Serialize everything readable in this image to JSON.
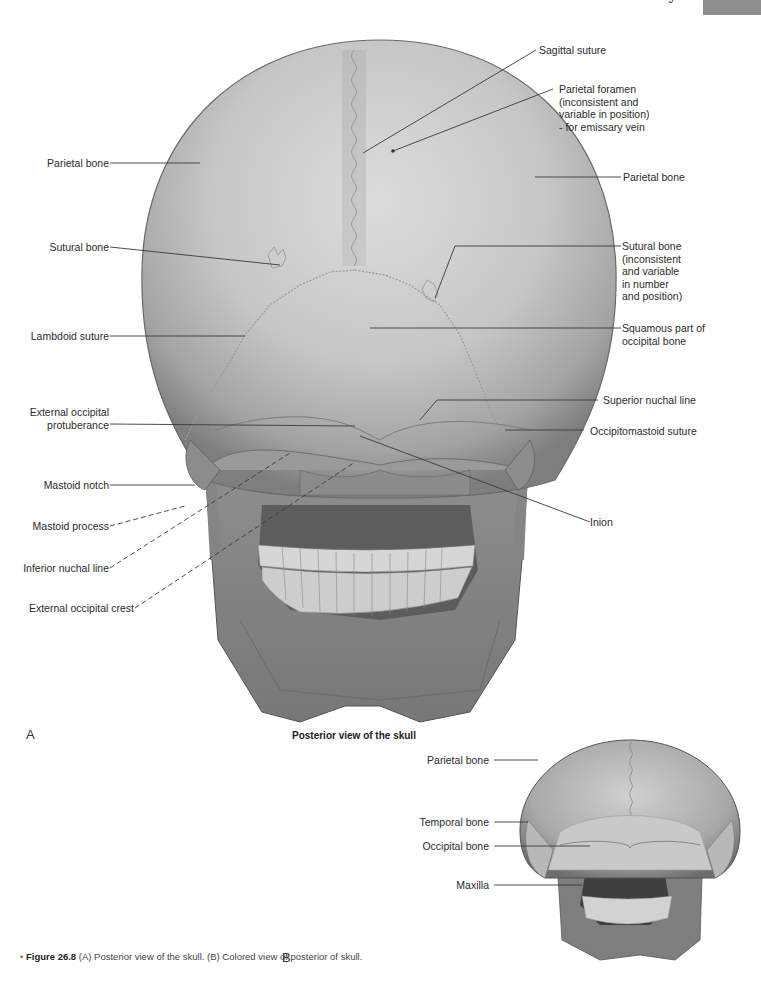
{
  "page": {
    "tab_color": "#8e8e8e",
    "page_number_fragment": "9"
  },
  "figure_a": {
    "letter": "A",
    "title": "Posterior view of the skull",
    "labels_left": [
      {
        "id": "parietal-bone-left",
        "text": "Parietal bone"
      },
      {
        "id": "sutural-bone-left",
        "text": "Sutural bone"
      },
      {
        "id": "lambdoid-suture",
        "text": "Lambdoid suture"
      },
      {
        "id": "external-occipital-protuberance",
        "text": "External occipital\nprotuberance"
      },
      {
        "id": "mastoid-notch",
        "text": "Mastoid notch"
      },
      {
        "id": "mastoid-process",
        "text": "Mastoid process"
      },
      {
        "id": "inferior-nuchal-line",
        "text": "Inferior nuchal line"
      },
      {
        "id": "external-occipital-crest",
        "text": "External occipital crest"
      }
    ],
    "labels_right": [
      {
        "id": "sagittal-suture",
        "text": "Sagittal suture"
      },
      {
        "id": "parietal-foramen",
        "text": "Parietal foramen\n(inconsistent and\nvariable in position)\n- for emissary vein"
      },
      {
        "id": "parietal-bone-right",
        "text": "Parietal bone"
      },
      {
        "id": "sutural-bone-right",
        "text": "Sutural bone\n(inconsistent\nand variable\nin number\nand position)"
      },
      {
        "id": "squamous-part",
        "text": "Squamous part of\noccipital bone"
      },
      {
        "id": "superior-nuchal-line",
        "text": "Superior nuchal line"
      },
      {
        "id": "occipitomastoid-suture",
        "text": "Occipitomastoid suture"
      },
      {
        "id": "inion",
        "text": "Inion"
      }
    ]
  },
  "figure_b": {
    "letter": "B",
    "labels": [
      {
        "id": "parietal-bone-b",
        "text": "Parietal bone"
      },
      {
        "id": "temporal-bone-b",
        "text": "Temporal bone"
      },
      {
        "id": "occipital-bone-b",
        "text": "Occipital bone"
      },
      {
        "id": "maxilla-b",
        "text": "Maxilla"
      }
    ]
  },
  "caption": {
    "bullet": "•",
    "figure_number": "Figure 26.8",
    "text": " (A) Posterior view of the skull. (B) Colored view of posterior of skull."
  }
}
